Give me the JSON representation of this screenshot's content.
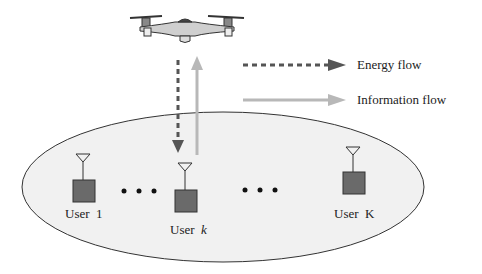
{
  "diagram": {
    "legend": {
      "energy_flow": "Energy flow",
      "information_flow": "Information flow"
    },
    "users": [
      {
        "prefix": "User",
        "index": "1",
        "italic": false
      },
      {
        "prefix": "User",
        "index": "k",
        "italic": true
      },
      {
        "prefix": "User",
        "index": "K",
        "italic": false
      }
    ],
    "ellipsis": "• • •",
    "colors": {
      "energy_arrow": "#555555",
      "information_arrow": "#b8b8b8",
      "user_box": "#6a6a6a",
      "ellipse_fill": "#f1f1f1",
      "ellipse_stroke": "#333333"
    }
  }
}
